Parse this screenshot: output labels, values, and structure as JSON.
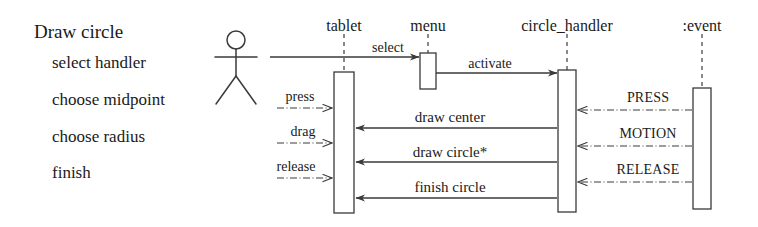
{
  "diagram": {
    "kind": "uml-sequence-diagram",
    "title": "Draw circle",
    "steps": [
      {
        "label": "Draw circle",
        "x": 34,
        "y": 22,
        "style": "title"
      },
      {
        "label": "select handler",
        "x": 52,
        "y": 54,
        "style": "item"
      },
      {
        "label": "choose midpoint",
        "x": 52,
        "y": 91,
        "style": "item"
      },
      {
        "label": "choose radius",
        "x": 52,
        "y": 128,
        "style": "item"
      },
      {
        "label": "finish",
        "x": 52,
        "y": 164,
        "style": "item"
      }
    ],
    "actor": {
      "name": "user-actor",
      "head_cx": 236,
      "head_cy": 40,
      "head_r": 9,
      "body_top": 49,
      "body_bottom": 76,
      "arm_y": 57,
      "arm_left": 215,
      "arm_right": 257,
      "leg_left_x": 216,
      "leg_right_x": 256,
      "leg_bottom": 104
    },
    "lifelines": [
      {
        "id": "tablet",
        "label": "tablet",
        "x": 344,
        "label_y": 18,
        "dash_top": 34,
        "dash_bottom": 72,
        "box": {
          "x": 334,
          "y": 72,
          "w": 20,
          "h": 141
        }
      },
      {
        "id": "menu",
        "label": "menu",
        "x": 428,
        "label_y": 18,
        "dash_top": 34,
        "dash_bottom": 53,
        "box": {
          "x": 420,
          "y": 53,
          "w": 16,
          "h": 36
        }
      },
      {
        "id": "circle_handler",
        "label": "circle_handler",
        "x": 567,
        "label_y": 18,
        "dash_top": 34,
        "dash_bottom": 70,
        "box": {
          "x": 558,
          "y": 70,
          "w": 18,
          "h": 142
        }
      },
      {
        "id": "event",
        "label": ":event",
        "x": 702,
        "label_y": 18,
        "dash_top": 34,
        "dash_bottom": 88,
        "box": {
          "x": 693,
          "y": 88,
          "w": 18,
          "h": 121
        }
      }
    ],
    "messages": [
      {
        "id": "select",
        "label": "select",
        "label_x": 388,
        "label_y": 41,
        "x1": 270,
        "x2": 419,
        "y": 57,
        "dir": "right",
        "line": "solid",
        "arrow": "filled"
      },
      {
        "id": "activate",
        "label": "activate",
        "label_x": 490,
        "label_y": 57,
        "x1": 436,
        "x2": 557,
        "y": 73,
        "dir": "right",
        "line": "solid",
        "arrow": "filled"
      },
      {
        "id": "press",
        "label": "press",
        "label_x": 300,
        "label_y": 90,
        "x1": 277,
        "x2": 332,
        "y": 108,
        "dir": "right",
        "line": "dashdot",
        "arrow": "open"
      },
      {
        "id": "drag",
        "label": "drag",
        "label_x": 303,
        "label_y": 125,
        "x1": 277,
        "x2": 332,
        "y": 143,
        "dir": "right",
        "line": "dashdot",
        "arrow": "open"
      },
      {
        "id": "release",
        "label": "release",
        "label_x": 296,
        "label_y": 160,
        "x1": 277,
        "x2": 332,
        "y": 178,
        "dir": "right",
        "line": "dashdot",
        "arrow": "open"
      },
      {
        "id": "draw_center",
        "label": "draw center",
        "label_x": 450,
        "label_y": 110,
        "x1": 557,
        "x2": 356,
        "y": 128,
        "dir": "left",
        "line": "solid",
        "arrow": "filled"
      },
      {
        "id": "draw_circle",
        "label": "draw circle*",
        "label_x": 450,
        "label_y": 145,
        "x1": 557,
        "x2": 356,
        "y": 162,
        "dir": "left",
        "line": "solid",
        "arrow": "filled"
      },
      {
        "id": "finish_circle",
        "label": "finish circle",
        "label_x": 450,
        "label_y": 180,
        "x1": 557,
        "x2": 356,
        "y": 198,
        "dir": "left",
        "line": "solid",
        "arrow": "filled"
      },
      {
        "id": "press_event",
        "label": "PRESS",
        "label_x": 648,
        "label_y": 91,
        "x1": 692,
        "x2": 578,
        "y": 110,
        "dir": "left",
        "line": "dashdot",
        "arrow": "open"
      },
      {
        "id": "motion_event",
        "label": "MOTION",
        "label_x": 648,
        "label_y": 127,
        "x1": 692,
        "x2": 578,
        "y": 146,
        "dir": "left",
        "line": "dashdot",
        "arrow": "open"
      },
      {
        "id": "release_event",
        "label": "RELEASE",
        "label_x": 648,
        "label_y": 163,
        "x1": 692,
        "x2": 578,
        "y": 182,
        "dir": "left",
        "line": "dashdot",
        "arrow": "open"
      }
    ],
    "colors": {
      "ink": "#1a1a1a",
      "line": "#3a3a3a",
      "background": "#ffffff",
      "box_fill": "#ffffff"
    }
  }
}
